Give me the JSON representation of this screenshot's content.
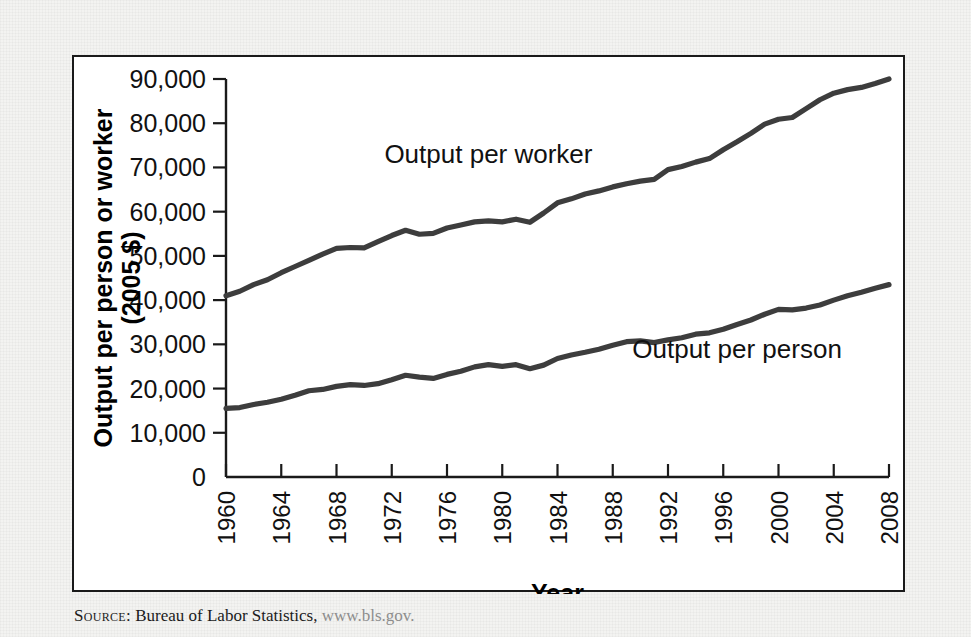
{
  "figure": {
    "source_prefix": "Source:",
    "source_text": "Bureau of Labor Statistics,",
    "source_url": "www.bls.gov."
  },
  "chart_data": {
    "type": "line",
    "title": "",
    "xlabel": "Year",
    "ylabel": "Output per person or worker (2005 $)",
    "ylabel_line1": "Output per person or worker",
    "ylabel_line2": "(2005 $)",
    "xlim": [
      1960,
      2008
    ],
    "ylim": [
      0,
      90000
    ],
    "ytick_values": [
      0,
      10000,
      20000,
      30000,
      40000,
      50000,
      60000,
      70000,
      80000,
      90000
    ],
    "ytick_labels": [
      "0",
      "10,000",
      "20,000",
      "30,000",
      "40,000",
      "50,000",
      "60,000",
      "70,000",
      "80,000",
      "90,000"
    ],
    "xtick_values": [
      1960,
      1964,
      1968,
      1972,
      1976,
      1980,
      1984,
      1988,
      1992,
      1996,
      2000,
      2004,
      2008
    ],
    "xtick_labels": [
      "1960",
      "1964",
      "1968",
      "1972",
      "1976",
      "1980",
      "1984",
      "1988",
      "1992",
      "1996",
      "2000",
      "2004",
      "2008"
    ],
    "grid": false,
    "legend_position": "inline-annotations",
    "line_color": "#3d3d3d",
    "x": [
      1960,
      1961,
      1962,
      1963,
      1964,
      1965,
      1966,
      1967,
      1968,
      1969,
      1970,
      1971,
      1972,
      1973,
      1974,
      1975,
      1976,
      1977,
      1978,
      1979,
      1980,
      1981,
      1982,
      1983,
      1984,
      1985,
      1986,
      1987,
      1988,
      1989,
      1990,
      1991,
      1992,
      1993,
      1994,
      1995,
      1996,
      1997,
      1998,
      1999,
      2000,
      2001,
      2002,
      2003,
      2004,
      2005,
      2006,
      2007,
      2008
    ],
    "series": [
      {
        "name": "Output per worker",
        "label": "Output per worker",
        "label_x": 1979,
        "label_y": 71000,
        "values": [
          41000,
          42000,
          43500,
          44600,
          46200,
          47600,
          49000,
          50400,
          51700,
          51900,
          51800,
          53200,
          54600,
          55800,
          54900,
          55100,
          56300,
          57000,
          57700,
          57900,
          57700,
          58300,
          57600,
          59700,
          62000,
          62900,
          64000,
          64700,
          65600,
          66300,
          66900,
          67300,
          69500,
          70200,
          71200,
          72000,
          74000,
          75800,
          77700,
          79800,
          80900,
          81300,
          83300,
          85300,
          86800,
          87600,
          88100,
          89000,
          90000
        ]
      },
      {
        "name": "Output per person",
        "label": "Output per person",
        "label_x": 1997,
        "label_y": 27000,
        "values": [
          15500,
          15700,
          16400,
          16900,
          17600,
          18500,
          19500,
          19800,
          20500,
          20900,
          20700,
          21100,
          22000,
          23000,
          22600,
          22300,
          23200,
          23900,
          24900,
          25400,
          25000,
          25400,
          24500,
          25300,
          26800,
          27600,
          28200,
          28900,
          29800,
          30600,
          30800,
          30400,
          31000,
          31500,
          32300,
          32600,
          33400,
          34500,
          35500,
          36800,
          37900,
          37800,
          38200,
          38900,
          40000,
          41000,
          41800,
          42700,
          43500
        ]
      }
    ]
  }
}
